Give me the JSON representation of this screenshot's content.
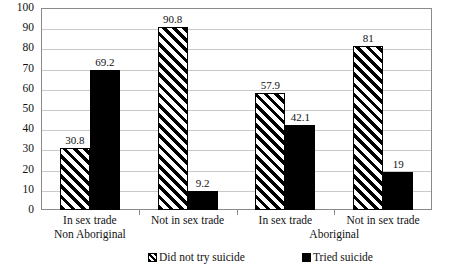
{
  "chart_data": {
    "type": "bar",
    "title": "",
    "subtitle": "",
    "xlabel": "",
    "ylabel": "",
    "ylim": [
      0,
      100
    ],
    "ytick_interval": 10,
    "yticks": [
      0,
      10,
      20,
      30,
      40,
      50,
      60,
      70,
      80,
      90,
      100
    ],
    "grid": true,
    "legend_position": "bottom",
    "categories": [
      "In sex trade",
      "Not in sex trade",
      "In sex trade",
      "Not in sex trade"
    ],
    "group_labels": [
      "Non Aboriginal",
      "Aboriginal"
    ],
    "series": [
      {
        "name": "Did not try suicide",
        "fill": "diagonal-hatch",
        "color": "#000000",
        "values": [
          30.8,
          90.8,
          57.9,
          81
        ]
      },
      {
        "name": "Tried suicide",
        "fill": "solid",
        "color": "#000000",
        "values": [
          69.2,
          9.2,
          42.1,
          19
        ]
      }
    ],
    "value_labels": [
      [
        "30.8",
        "69.2"
      ],
      [
        "90.8",
        "9.2"
      ],
      [
        "57.9",
        "42.1"
      ],
      [
        "81",
        "19"
      ]
    ]
  },
  "legend": {
    "items": [
      {
        "label": "Did not try suicide",
        "swatch": "hatch-swatch"
      },
      {
        "label": "Tried suicide",
        "swatch": "solid-swatch"
      }
    ]
  },
  "axis": {
    "y_tick_labels": [
      "100",
      "90",
      "80",
      "70",
      "60",
      "50",
      "40",
      "30",
      "20",
      "10",
      "0"
    ]
  },
  "colors": {
    "grid": "#c9c9c9",
    "frame": "#8a8a8a",
    "bar": "#000000",
    "background": "#ffffff",
    "text": "#111111"
  }
}
